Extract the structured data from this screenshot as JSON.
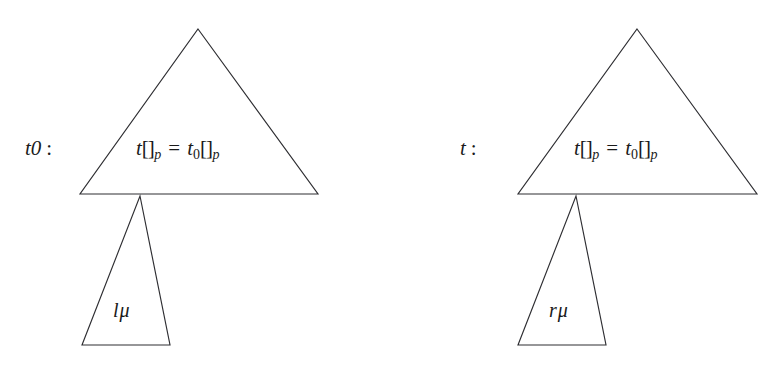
{
  "figure": {
    "background_color": "#ffffff",
    "stroke_color": "#2e2e32",
    "panels": [
      {
        "id": "left",
        "side_label": {
          "term": "t",
          "term_subscript": "0",
          "colon": ":"
        },
        "big_triangle": {
          "formula": {
            "left_term": "t",
            "left_brackets": "[]",
            "left_subscript": "p",
            "relation": "=",
            "right_term": "t",
            "right_term_subscript": "0",
            "right_brackets": "[]",
            "right_subscript": "p"
          }
        },
        "small_triangle": {
          "label_term": "l",
          "label_symbol": "μ"
        }
      },
      {
        "id": "right",
        "side_label": {
          "term": "t",
          "term_subscript": "",
          "colon": ":"
        },
        "big_triangle": {
          "formula": {
            "left_term": "t",
            "left_brackets": "[]",
            "left_subscript": "p",
            "relation": "=",
            "right_term": "t",
            "right_term_subscript": "0",
            "right_brackets": "[]",
            "right_subscript": "p"
          }
        },
        "small_triangle": {
          "label_term": "r",
          "label_symbol": "μ"
        }
      }
    ]
  }
}
